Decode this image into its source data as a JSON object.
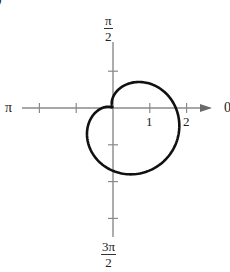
{
  "chart_data": {
    "type": "line",
    "subtype": "polar",
    "title": "",
    "equation_implied": "r = 1 + cos(theta + pi/4)",
    "angle_labels": {
      "right": "0",
      "top_num": "π",
      "top_den": "2",
      "left": "π",
      "bottom_num": "3π",
      "bottom_den": "2"
    },
    "radial_tick_labels": [
      "1",
      "2"
    ],
    "radial_ticks": [
      -2,
      -1,
      1,
      2
    ],
    "vertical_ticks": [
      1,
      -1,
      -2,
      -3
    ],
    "axis_range": {
      "x": [
        -2.5,
        2.5
      ],
      "y": [
        -3.5,
        1.8
      ]
    },
    "grid": false,
    "legend": null,
    "curve": {
      "description": "cardioid with cusp at origin, opening toward 3π/4, maximum r = 2 along θ = -π/4",
      "sample_points_polar": [
        {
          "theta": 0,
          "r": 1.71
        },
        {
          "theta": 0.785,
          "r": 1.0
        },
        {
          "theta": 1.571,
          "r": 0.29
        },
        {
          "theta": 2.356,
          "r": 0.0
        },
        {
          "theta": 3.142,
          "r": 0.29
        },
        {
          "theta": 3.927,
          "r": 1.0
        },
        {
          "theta": 4.712,
          "r": 1.71
        },
        {
          "theta": 5.498,
          "r": 2.0
        }
      ],
      "color": "#111111"
    },
    "axis_color": "#8a8a8a"
  },
  "corner_fragment": ")"
}
